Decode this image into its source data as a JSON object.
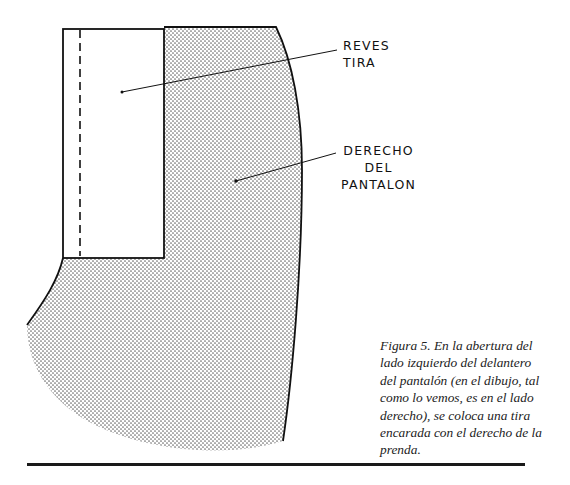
{
  "figure": {
    "labels": {
      "reves_tira": [
        "REVES",
        "TIRA"
      ],
      "derecho_pantalon": [
        "DERECHO",
        "DEL",
        "PANTALON"
      ]
    },
    "regions": {
      "strip": "reverse side of strip (white)",
      "trouser": "right side of trouser (dotted shading)"
    },
    "colors": {
      "ink": "#111111",
      "dot": "#6b6b6b",
      "background": "#ffffff"
    }
  },
  "caption": {
    "lines": [
      "Figura 5.  En la abertura del",
      "lado izquierdo del delantero",
      "del pantalón (en el dibujo, tal",
      "como lo vemos, es en el lado",
      "derecho), se coloca una tira",
      "encarada con el derecho de la",
      "prenda."
    ]
  }
}
